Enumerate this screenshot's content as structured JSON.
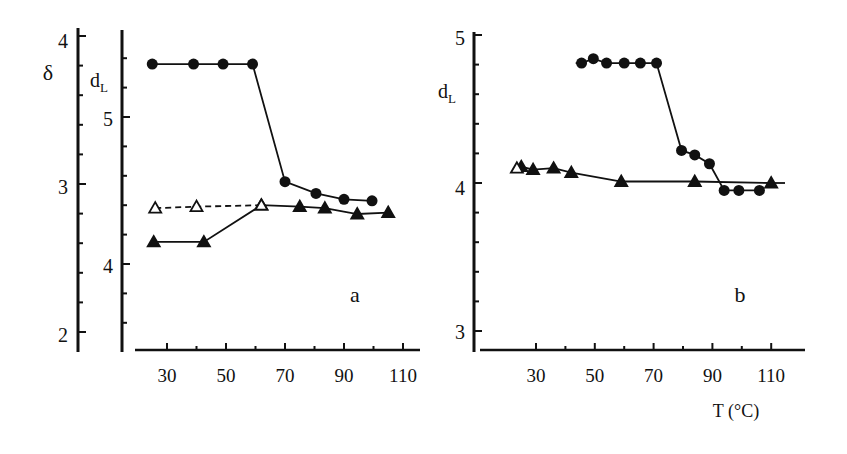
{
  "figure": {
    "panel_a_label": "a",
    "panel_b_label": "b",
    "x_axis_title": "T (°C)",
    "ink_color": "#111111",
    "background": "#ffffff"
  },
  "chart_data": [
    {
      "panel": "a",
      "type": "line",
      "xlabel": "T (°C)",
      "xticks": [
        30,
        50,
        70,
        90,
        110
      ],
      "xlim": [
        20,
        118
      ],
      "axes": [
        {
          "name": "δ",
          "side": "left-outer",
          "ticks": [
            2,
            3,
            4
          ],
          "ylim": [
            1.9,
            4.05
          ]
        },
        {
          "name": "d_L",
          "ylabel": "d_L",
          "side": "left-inner",
          "ticks": [
            4,
            5
          ],
          "ylim": [
            3.4,
            5.6
          ]
        }
      ],
      "series": [
        {
          "name": "filled circles",
          "marker": "circle-filled",
          "line": "solid",
          "x": [
            25,
            39,
            49,
            59,
            70,
            80.5,
            90,
            99.5
          ],
          "y": [
            5.36,
            5.36,
            5.36,
            5.36,
            4.56,
            4.48,
            4.44,
            4.43
          ]
        },
        {
          "name": "filled triangles",
          "marker": "triangle-filled",
          "line": "solid",
          "x": [
            25.5,
            42.5,
            62,
            75,
            83.5,
            94.5,
            105
          ],
          "y": [
            4.15,
            4.15,
            4.4,
            4.39,
            4.38,
            4.34,
            4.35
          ]
        },
        {
          "name": "open triangles",
          "marker": "triangle-open",
          "line": "dashed",
          "x": [
            26,
            40,
            62
          ],
          "y": [
            4.38,
            4.39,
            4.4
          ]
        }
      ],
      "annotation": "a",
      "grid": false
    },
    {
      "panel": "b",
      "type": "line",
      "xlabel": "T (°C)",
      "xticks": [
        30,
        50,
        70,
        90,
        110
      ],
      "xlim": [
        20,
        118
      ],
      "ylabel": "d_L",
      "yticks": [
        3,
        4,
        5
      ],
      "ylim": [
        3,
        5.05
      ],
      "series": [
        {
          "name": "filled circles",
          "marker": "circle-filled",
          "line": "solid",
          "x": [
            45.5,
            49.5,
            54,
            60,
            65.5,
            71,
            79.5,
            84,
            89,
            94,
            99,
            106
          ],
          "y": [
            4.81,
            4.84,
            4.81,
            4.81,
            4.81,
            4.81,
            4.22,
            4.19,
            4.13,
            3.95,
            3.95,
            3.95
          ]
        },
        {
          "name": "filled triangles",
          "marker": "triangle-filled",
          "line": "solid",
          "x": [
            25,
            29,
            36,
            42,
            59,
            84,
            110
          ],
          "y": [
            4.11,
            4.09,
            4.1,
            4.07,
            4.01,
            4.01,
            4.0
          ]
        },
        {
          "name": "open triangle",
          "marker": "triangle-open",
          "line": "none",
          "x": [
            23.5
          ],
          "y": [
            4.1
          ]
        }
      ],
      "annotation": "b",
      "grid": false
    }
  ]
}
